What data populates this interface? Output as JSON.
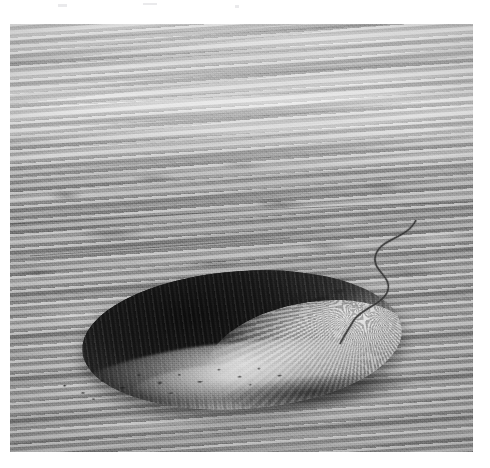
{
  "page": {
    "background_color": "#ffffff",
    "width": 490,
    "height": 468,
    "margin_note": ""
  },
  "photo": {
    "kind": "photograph",
    "medium": "black-and-white halftone print",
    "subject": "impact crater seen from the air",
    "view": "oblique aerial view looking across a flat desert plain toward a hazy horizon",
    "x": 10,
    "y": 24,
    "width": 463,
    "height": 428,
    "border_color": "#9a9a9a",
    "tone": {
      "deepest_shadow": "#0a0a0a",
      "shadow": "#1b1b1b",
      "midtone": "#8d8d8d",
      "highlight": "#e9e9e9",
      "paper_white": "#ffffff"
    },
    "regions": [
      {
        "name": "horizon-haze",
        "label": "Hazy, washed-out horizon with horizontal atmospheric banding",
        "tone": "#cfcfcf"
      },
      {
        "name": "distant-plain",
        "label": "Flat mottled desert plain stretching to the horizon",
        "tone": "#9e9e9e"
      },
      {
        "name": "crater",
        "label": "Bowl-shaped impact crater occupying the lower half of the frame",
        "tone": "#141414"
      },
      {
        "name": "crater-shadowed-wall",
        "label": "Far inner wall in deep shadow, nearly black, with fine vertical striations",
        "tone": "#121212"
      },
      {
        "name": "crater-sunlit-wall",
        "label": "Near-right inner wall in full sun, showing radial gullies and slumped terraces",
        "tone": "#d2d2d2"
      },
      {
        "name": "crater-floor",
        "label": "Pale flat crater floor with talus debris",
        "tone": "#d8d8d8"
      },
      {
        "name": "rim-crest",
        "label": "Bright uplifted rim crest ringing the crater",
        "tone": "#ececec"
      },
      {
        "name": "rubble-field",
        "label": "Scattered dark boulders and rubble along the near rim",
        "tone": "#1e1e1e"
      },
      {
        "name": "ejecta-blanket",
        "label": "Foreground ejecta blanket of rubbly, hummocky ground",
        "tone": "#8a8a8a"
      },
      {
        "name": "access-road",
        "label": "Narrow winding dirt road descending from the upper right toward the rim",
        "tone": "#2b2b2b"
      }
    ]
  }
}
